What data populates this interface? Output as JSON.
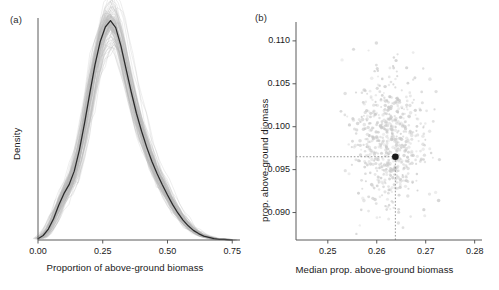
{
  "figure": {
    "background": "#ffffff",
    "width": 499,
    "height": 290
  },
  "panel_a": {
    "label": "(a)",
    "xlabel": "Proportion of above-ground biomass",
    "ylabel": "Density",
    "xticks": [
      "0.00",
      "0.25",
      "0.50",
      "0.75"
    ],
    "yticks": []
  },
  "panel_b": {
    "label": "(b)",
    "xlabel": "Median prop. above-ground biomass",
    "ylabel": "prop. above-ground diomass",
    "xticks": [
      "0.25",
      "0.26",
      "0.27",
      "0.28"
    ],
    "yticks": [
      "0.110",
      "0.105",
      "0.100",
      "0.095",
      "0.090"
    ]
  },
  "colors": {
    "line": "#2b2b2b",
    "band": "#b3b3b3",
    "axis": "#5a5a5a",
    "point": "#1a1a1a",
    "scatter": "#c8c8c8",
    "guide": "#8c8c8c",
    "text": "#1a1a1a"
  },
  "chart_data": [
    {
      "type": "area",
      "panel": "(a)",
      "title": "",
      "xlabel": "Proportion of above-ground biomass",
      "ylabel": "Density",
      "xlim": [
        0.0,
        0.78
      ],
      "ylim": [
        0.0,
        3.45
      ],
      "xticks": [
        0.0,
        0.25,
        0.5,
        0.75
      ],
      "yticks": [],
      "grid": false,
      "legend": "none",
      "description": "Kernel density of the proportion of above-ground biomass; black line is the point estimate, grey band is the bootstrap envelope.",
      "x": [
        0.0,
        0.02,
        0.04,
        0.06,
        0.08,
        0.1,
        0.12,
        0.14,
        0.16,
        0.18,
        0.2,
        0.22,
        0.24,
        0.26,
        0.28,
        0.3,
        0.32,
        0.34,
        0.36,
        0.38,
        0.4,
        0.42,
        0.44,
        0.46,
        0.48,
        0.5,
        0.52,
        0.54,
        0.56,
        0.58,
        0.6,
        0.62,
        0.64,
        0.66,
        0.68,
        0.7,
        0.72,
        0.75
      ],
      "series": [
        {
          "name": "median density",
          "values": [
            0.02,
            0.07,
            0.17,
            0.33,
            0.54,
            0.72,
            0.86,
            1.07,
            1.4,
            1.82,
            2.28,
            2.72,
            3.08,
            3.31,
            3.41,
            3.3,
            3.02,
            2.66,
            2.3,
            1.97,
            1.69,
            1.44,
            1.22,
            1.03,
            0.86,
            0.7,
            0.55,
            0.42,
            0.31,
            0.22,
            0.15,
            0.1,
            0.06,
            0.04,
            0.02,
            0.01,
            0.01,
            0.0
          ]
        },
        {
          "name": "bootstrap upper",
          "values": [
            0.05,
            0.13,
            0.26,
            0.45,
            0.68,
            0.88,
            1.04,
            1.27,
            1.62,
            2.05,
            2.52,
            2.95,
            3.27,
            3.46,
            3.52,
            3.4,
            3.14,
            2.8,
            2.45,
            2.13,
            1.85,
            1.6,
            1.37,
            1.17,
            0.99,
            0.82,
            0.66,
            0.52,
            0.39,
            0.29,
            0.21,
            0.14,
            0.09,
            0.06,
            0.04,
            0.02,
            0.01,
            0.0
          ]
        },
        {
          "name": "bootstrap lower",
          "values": [
            0.0,
            0.03,
            0.1,
            0.23,
            0.41,
            0.57,
            0.7,
            0.89,
            1.19,
            1.59,
            2.03,
            2.47,
            2.85,
            3.12,
            3.26,
            3.18,
            2.9,
            2.52,
            2.15,
            1.82,
            1.54,
            1.29,
            1.08,
            0.9,
            0.74,
            0.59,
            0.45,
            0.33,
            0.24,
            0.16,
            0.1,
            0.06,
            0.04,
            0.02,
            0.01,
            0.0,
            0.0,
            0.0
          ]
        }
      ]
    },
    {
      "type": "scatter",
      "panel": "(b)",
      "title": "",
      "xlabel": "Median prop. above-ground biomass",
      "ylabel": "prop. above-ground diomass",
      "xlim": [
        0.2435,
        0.2815
      ],
      "ylim": [
        0.0868,
        0.1122
      ],
      "xticks": [
        0.25,
        0.26,
        0.27,
        0.28
      ],
      "yticks": [
        0.09,
        0.095,
        0.1,
        0.105,
        0.11
      ],
      "grid": false,
      "legend": "none",
      "description": "Bootstrap replicates of the median proportion versus the proportion of above-ground biomass; filled black point marks the observed estimate, dotted guides drop to the axes.",
      "highlight_point": {
        "x": 0.2638,
        "y": 0.0965,
        "label": "observed estimate"
      },
      "n_points": 640,
      "cloud_center": {
        "x": 0.2627,
        "y": 0.0983
      },
      "cloud_sd": {
        "x": 0.0036,
        "y": 0.0038
      }
    }
  ]
}
